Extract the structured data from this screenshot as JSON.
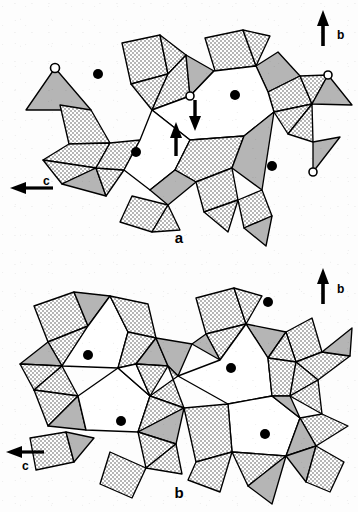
{
  "figure": {
    "type": "crystal-structure-polyhedral-diagram",
    "background_color": "#ffffff",
    "line_color": "#000000",
    "width": 358,
    "height": 512
  },
  "panels": [
    {
      "id": "a",
      "label": "a",
      "description": "Polyhedral framework projection, single chain layer with displacement arrows",
      "axes": [
        {
          "name": "b",
          "label": "b",
          "direction": "up",
          "x": 323,
          "y": 12,
          "length": 34
        },
        {
          "name": "c",
          "label": "c",
          "direction": "left",
          "x": 12,
          "y": 188,
          "length": 44
        }
      ],
      "filled_sites": [
        {
          "x": 98,
          "y": 74
        },
        {
          "x": 235,
          "y": 95
        },
        {
          "x": 136,
          "y": 152
        },
        {
          "x": 272,
          "y": 166
        }
      ],
      "open_sites": [
        {
          "x": 55,
          "y": 68
        },
        {
          "x": 190,
          "y": 96
        },
        {
          "x": 328,
          "y": 75
        },
        {
          "x": 313,
          "y": 172
        }
      ],
      "displacement_arrows": [
        {
          "id": "down-arrow",
          "x": 195,
          "y": 100,
          "direction": "down",
          "length": 30
        },
        {
          "id": "up-arrow",
          "x": 175,
          "y": 152,
          "direction": "up",
          "length": 32
        }
      ]
    },
    {
      "id": "b",
      "label": "b",
      "description": "Polyhedral framework projection, doubled layer without displacement arrows",
      "axes": [
        {
          "name": "b",
          "label": "b",
          "direction": "up",
          "x": 323,
          "y": 268,
          "length": 34
        },
        {
          "name": "c",
          "label": "c",
          "direction": "left",
          "x": 8,
          "y": 452,
          "length": 36
        }
      ],
      "filled_sites": [
        {
          "x": 268,
          "y": 302
        },
        {
          "x": 88,
          "y": 355
        },
        {
          "x": 231,
          "y": 368
        },
        {
          "x": 121,
          "y": 421
        },
        {
          "x": 265,
          "y": 434
        }
      ],
      "open_sites": [],
      "displacement_arrows": []
    }
  ],
  "legend_semantics": {
    "stippled_polyhedron": "tetrahedron viewed with dotted fill",
    "gray_polyhedron": "tetrahedron viewed with solid gray fill",
    "white_polygon": "open channel / cavity",
    "filled_circle": "cation site in channel",
    "open_circle": "apical oxygen / hydroxyl site",
    "arrow": "atomic displacement direction"
  },
  "colors": {
    "stipple_fill": "#d8d8d8",
    "gray_fill": "#b3b3b3",
    "white_fill": "#ffffff",
    "outline": "#000000",
    "marker_filled": "#000000",
    "marker_open_stroke": "#000000",
    "marker_open_fill": "#ffffff"
  }
}
